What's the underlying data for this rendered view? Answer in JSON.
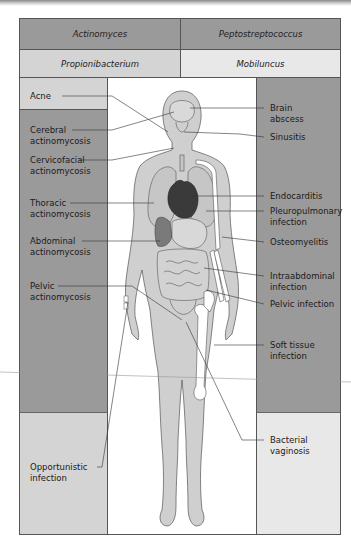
{
  "table": {
    "row1": {
      "left": "Actinomyces",
      "right": "Peptostreptococcus"
    },
    "row2": {
      "left": "Propionibacterium",
      "right": "Mobiluncus"
    }
  },
  "left_labels": [
    {
      "text": "Acne"
    },
    {
      "text": "Cerebral\nactinomycosis"
    },
    {
      "text": "Cervicofacial\nactinomycosis"
    },
    {
      "text": "Thoracic\nactinomycosis"
    },
    {
      "text": "Abdominal\nactinomycosis"
    },
    {
      "text": "Pelvic\nactinomycosis"
    },
    {
      "text": "Opportunistic\ninfection"
    }
  ],
  "right_labels": [
    {
      "text": "Brain\nabscess"
    },
    {
      "text": "Sinusitis"
    },
    {
      "text": "Endocarditis"
    },
    {
      "text": "Pleuropulmonary\ninfection"
    },
    {
      "text": "Osteomyelitis"
    },
    {
      "text": "Intraabdominal\ninfection"
    },
    {
      "text": "Pelvic infection"
    },
    {
      "text": "Soft tissue\ninfection"
    },
    {
      "text": "Bacterial\nvaginosis"
    }
  ],
  "colors": {
    "dark_panel": "#9a9a9a",
    "light_panel": "#d4d4d4",
    "body_fill": "#cfcfcf",
    "organ_fill": "#bdbdbd",
    "heart_fill": "#3a3a3a",
    "liver_fill": "#7a7a7a"
  }
}
